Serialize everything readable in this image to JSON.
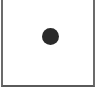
{
  "canvas": {
    "background": "#ffffff",
    "border_color": "#6b6b6b"
  },
  "dot": {
    "shape": "circle",
    "color": "#2a2a2a"
  }
}
